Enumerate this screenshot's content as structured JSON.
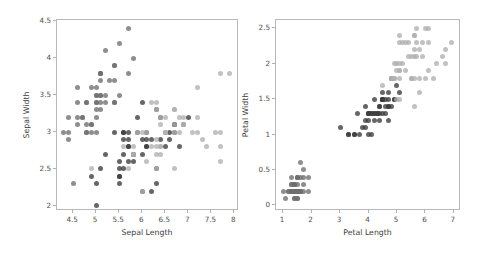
{
  "figure": {
    "width": 486,
    "height": 256,
    "background": "#ffffff"
  },
  "palette": {
    "setosa": "#6e6e6e",
    "versicolor": "#3b3b3b",
    "virginica": "#b0b0b0",
    "spine": "#b8b8b8",
    "tick_text": "#4d4d4d",
    "axis_text": "#3d3d3d"
  },
  "panels": [
    {
      "id": "left",
      "xlabel": "Sepal Length",
      "ylabel": "Sepal Width",
      "xticks": [
        "4.5",
        "5.0",
        "5.5",
        "6.0",
        "6.5",
        "7.0",
        "7.5",
        "8.0"
      ],
      "yticks": [
        "2.0",
        "2.5",
        "3.0",
        "3.5",
        "4.0",
        "4.5"
      ]
    },
    {
      "id": "right",
      "xlabel": "Petal Length",
      "ylabel": "Petal Width",
      "xticks": [
        "1",
        "2",
        "3",
        "4",
        "5",
        "6",
        "7"
      ],
      "yticks": [
        "0.0",
        "0.5",
        "1.0",
        "1.5",
        "2.0",
        "2.5"
      ]
    }
  ],
  "chart_data": [
    {
      "type": "scatter",
      "panel": "left",
      "title": "",
      "xlabel": "Sepal Length",
      "ylabel": "Sepal Width",
      "xlim": [
        4.15,
        8.1
      ],
      "ylim": [
        1.93,
        4.52
      ],
      "xticks": [
        4.5,
        5.0,
        5.5,
        6.0,
        6.5,
        7.0,
        7.5,
        8.0
      ],
      "yticks": [
        2.0,
        2.5,
        3.0,
        3.5,
        4.0,
        4.5
      ],
      "grid": false,
      "legend": "none",
      "marker_size_px": 5,
      "series": [
        {
          "name": "setosa",
          "color": "#6e6e6e",
          "x": [
            5.1,
            4.9,
            4.7,
            4.6,
            5.0,
            5.4,
            4.6,
            5.0,
            4.4,
            4.9,
            5.4,
            4.8,
            4.8,
            4.3,
            5.8,
            5.7,
            5.4,
            5.1,
            5.7,
            5.1,
            5.4,
            5.1,
            4.6,
            5.1,
            4.8,
            5.0,
            5.0,
            5.2,
            5.2,
            4.7,
            4.8,
            5.4,
            5.2,
            5.5,
            4.9,
            5.0,
            5.5,
            4.9,
            4.4,
            5.1,
            5.0,
            4.5,
            4.4,
            5.0,
            5.1,
            4.8,
            5.1,
            4.6,
            5.3,
            5.0
          ],
          "y": [
            3.5,
            3.0,
            3.2,
            3.1,
            3.6,
            3.9,
            3.4,
            3.4,
            2.9,
            3.1,
            3.7,
            3.4,
            3.0,
            3.0,
            4.0,
            4.4,
            3.9,
            3.5,
            3.8,
            3.8,
            3.4,
            3.7,
            3.6,
            3.3,
            3.4,
            3.0,
            3.4,
            3.5,
            3.4,
            3.2,
            3.1,
            3.4,
            4.1,
            4.2,
            3.1,
            3.2,
            3.5,
            3.6,
            3.0,
            3.4,
            3.5,
            2.3,
            3.2,
            3.5,
            3.8,
            3.0,
            3.8,
            3.2,
            3.7,
            3.3
          ]
        },
        {
          "name": "versicolor",
          "color": "#3b3b3b",
          "x": [
            7.0,
            6.4,
            6.9,
            5.5,
            6.5,
            5.7,
            6.3,
            4.9,
            6.6,
            5.2,
            5.0,
            5.9,
            6.0,
            6.1,
            5.6,
            6.7,
            5.6,
            5.8,
            6.2,
            5.6,
            5.9,
            6.1,
            6.3,
            6.1,
            6.4,
            6.6,
            6.8,
            6.7,
            6.0,
            5.7,
            5.5,
            5.5,
            5.8,
            6.0,
            5.4,
            6.0,
            6.7,
            6.3,
            5.6,
            5.5,
            5.5,
            6.1,
            5.8,
            5.0,
            5.6,
            5.7,
            5.7,
            6.2,
            5.1,
            5.7
          ],
          "y": [
            3.2,
            3.2,
            3.1,
            2.3,
            2.8,
            2.8,
            3.3,
            2.4,
            2.9,
            2.7,
            2.0,
            3.0,
            2.2,
            2.9,
            2.9,
            3.1,
            3.0,
            2.7,
            2.2,
            2.5,
            3.2,
            2.8,
            2.5,
            2.8,
            2.9,
            3.0,
            2.8,
            3.0,
            2.9,
            2.6,
            2.4,
            2.4,
            2.7,
            2.7,
            3.0,
            3.4,
            3.1,
            2.3,
            3.0,
            2.5,
            2.6,
            3.0,
            2.6,
            2.3,
            2.7,
            3.0,
            2.9,
            2.9,
            2.5,
            2.8
          ]
        },
        {
          "name": "virginica",
          "color": "#b0b0b0",
          "x": [
            6.3,
            5.8,
            7.1,
            6.3,
            6.5,
            7.6,
            4.9,
            7.3,
            6.7,
            7.2,
            6.5,
            6.4,
            6.8,
            5.7,
            5.8,
            6.4,
            6.5,
            7.7,
            7.7,
            6.0,
            6.9,
            5.6,
            7.7,
            6.3,
            6.7,
            7.2,
            6.2,
            6.1,
            6.4,
            7.2,
            7.4,
            7.9,
            6.4,
            6.3,
            6.1,
            7.7,
            6.3,
            6.4,
            6.0,
            6.9,
            6.7,
            6.9,
            5.8,
            6.8,
            6.7,
            6.7,
            6.3,
            6.5,
            6.2,
            5.9
          ],
          "y": [
            3.3,
            2.7,
            3.0,
            2.9,
            3.0,
            3.0,
            2.5,
            2.9,
            2.5,
            3.6,
            3.2,
            2.7,
            3.0,
            2.5,
            2.8,
            3.2,
            3.0,
            3.8,
            2.6,
            2.2,
            3.2,
            2.8,
            2.8,
            2.7,
            3.3,
            3.2,
            2.8,
            3.0,
            2.8,
            3.0,
            2.8,
            3.8,
            2.8,
            2.8,
            2.6,
            3.0,
            3.4,
            3.1,
            3.0,
            3.1,
            3.1,
            3.1,
            2.7,
            3.2,
            3.3,
            3.0,
            2.5,
            3.0,
            3.4,
            3.0
          ]
        }
      ]
    },
    {
      "type": "scatter",
      "panel": "right",
      "title": "",
      "xlabel": "Petal Length",
      "ylabel": "Petal Width",
      "xlim": [
        0.75,
        7.25
      ],
      "ylim": [
        -0.08,
        2.62
      ],
      "xticks": [
        1,
        2,
        3,
        4,
        5,
        6,
        7
      ],
      "yticks": [
        0.0,
        0.5,
        1.0,
        1.5,
        2.0,
        2.5
      ],
      "grid": false,
      "legend": "none",
      "marker_size_px": 5,
      "series": [
        {
          "name": "setosa",
          "color": "#6e6e6e",
          "x": [
            1.4,
            1.4,
            1.3,
            1.5,
            1.4,
            1.7,
            1.4,
            1.5,
            1.4,
            1.5,
            1.5,
            1.6,
            1.4,
            1.1,
            1.2,
            1.5,
            1.3,
            1.4,
            1.7,
            1.5,
            1.7,
            1.5,
            1.0,
            1.7,
            1.9,
            1.6,
            1.6,
            1.5,
            1.4,
            1.6,
            1.6,
            1.5,
            1.5,
            1.4,
            1.5,
            1.2,
            1.3,
            1.4,
            1.3,
            1.5,
            1.3,
            1.3,
            1.3,
            1.6,
            1.9,
            1.4,
            1.6,
            1.4,
            1.5,
            1.4
          ],
          "y": [
            0.2,
            0.2,
            0.2,
            0.2,
            0.2,
            0.4,
            0.3,
            0.2,
            0.2,
            0.1,
            0.2,
            0.2,
            0.1,
            0.1,
            0.2,
            0.4,
            0.4,
            0.3,
            0.3,
            0.3,
            0.2,
            0.4,
            0.2,
            0.5,
            0.2,
            0.2,
            0.4,
            0.2,
            0.2,
            0.2,
            0.2,
            0.4,
            0.1,
            0.2,
            0.2,
            0.2,
            0.2,
            0.1,
            0.2,
            0.2,
            0.3,
            0.3,
            0.2,
            0.6,
            0.4,
            0.3,
            0.2,
            0.2,
            0.2,
            0.2
          ]
        },
        {
          "name": "versicolor",
          "color": "#3b3b3b",
          "x": [
            4.7,
            4.5,
            4.9,
            4.0,
            4.6,
            4.5,
            4.7,
            3.3,
            4.6,
            3.9,
            3.5,
            4.2,
            4.0,
            4.7,
            3.6,
            4.4,
            4.5,
            4.1,
            4.5,
            3.9,
            4.8,
            4.0,
            4.9,
            4.7,
            4.3,
            4.4,
            4.8,
            5.0,
            4.5,
            3.5,
            3.8,
            3.7,
            3.9,
            5.1,
            4.5,
            4.5,
            4.7,
            4.4,
            4.1,
            4.0,
            4.4,
            4.6,
            4.0,
            3.3,
            4.2,
            4.2,
            4.2,
            4.3,
            3.0,
            4.1
          ],
          "y": [
            1.4,
            1.5,
            1.5,
            1.3,
            1.5,
            1.3,
            1.6,
            1.0,
            1.3,
            1.4,
            1.0,
            1.5,
            1.0,
            1.4,
            1.3,
            1.4,
            1.5,
            1.0,
            1.5,
            1.1,
            1.8,
            1.3,
            1.5,
            1.2,
            1.3,
            1.4,
            1.4,
            1.7,
            1.5,
            1.0,
            1.1,
            1.0,
            1.2,
            1.6,
            1.5,
            1.6,
            1.5,
            1.3,
            1.3,
            1.3,
            1.2,
            1.4,
            1.2,
            1.0,
            1.3,
            1.2,
            1.3,
            1.3,
            1.1,
            1.3
          ]
        },
        {
          "name": "virginica",
          "color": "#b0b0b0",
          "x": [
            6.0,
            5.1,
            5.9,
            5.6,
            5.8,
            6.6,
            4.5,
            6.3,
            5.8,
            6.1,
            5.1,
            5.3,
            5.5,
            5.0,
            5.1,
            5.3,
            5.5,
            6.7,
            6.9,
            5.0,
            5.7,
            4.9,
            6.7,
            4.9,
            5.7,
            6.0,
            4.8,
            4.9,
            5.6,
            5.8,
            6.1,
            6.4,
            5.6,
            5.1,
            5.6,
            6.1,
            5.6,
            5.5,
            4.8,
            5.4,
            5.6,
            5.1,
            5.1,
            5.9,
            5.7,
            5.2,
            5.0,
            5.2,
            5.4,
            5.1
          ],
          "y": [
            2.5,
            1.9,
            2.1,
            1.8,
            2.2,
            2.1,
            1.7,
            1.8,
            1.8,
            2.5,
            2.0,
            1.9,
            2.1,
            2.0,
            2.4,
            2.3,
            1.8,
            2.2,
            2.3,
            1.5,
            2.3,
            2.0,
            2.0,
            1.8,
            2.1,
            1.8,
            1.8,
            1.8,
            2.1,
            1.6,
            1.9,
            2.0,
            2.2,
            1.5,
            1.4,
            2.3,
            2.4,
            1.8,
            1.8,
            2.1,
            2.4,
            2.3,
            1.9,
            2.3,
            2.5,
            2.3,
            1.9,
            2.0,
            2.3,
            1.8
          ]
        }
      ]
    }
  ]
}
